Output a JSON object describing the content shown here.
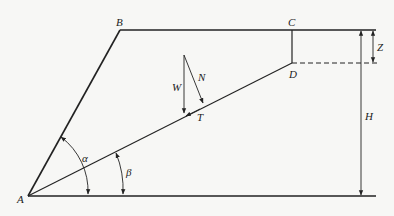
{
  "diagram": {
    "points": {
      "A": "A",
      "B": "B",
      "C": "C",
      "D": "D",
      "T": "T"
    },
    "forces": {
      "W": "W",
      "N": "N"
    },
    "angles": {
      "alpha": "α",
      "beta": "β"
    },
    "dimensions": {
      "Z": "Z",
      "H": "H"
    },
    "colors": {
      "line": "#222222",
      "background": "#f7f7f5"
    }
  }
}
